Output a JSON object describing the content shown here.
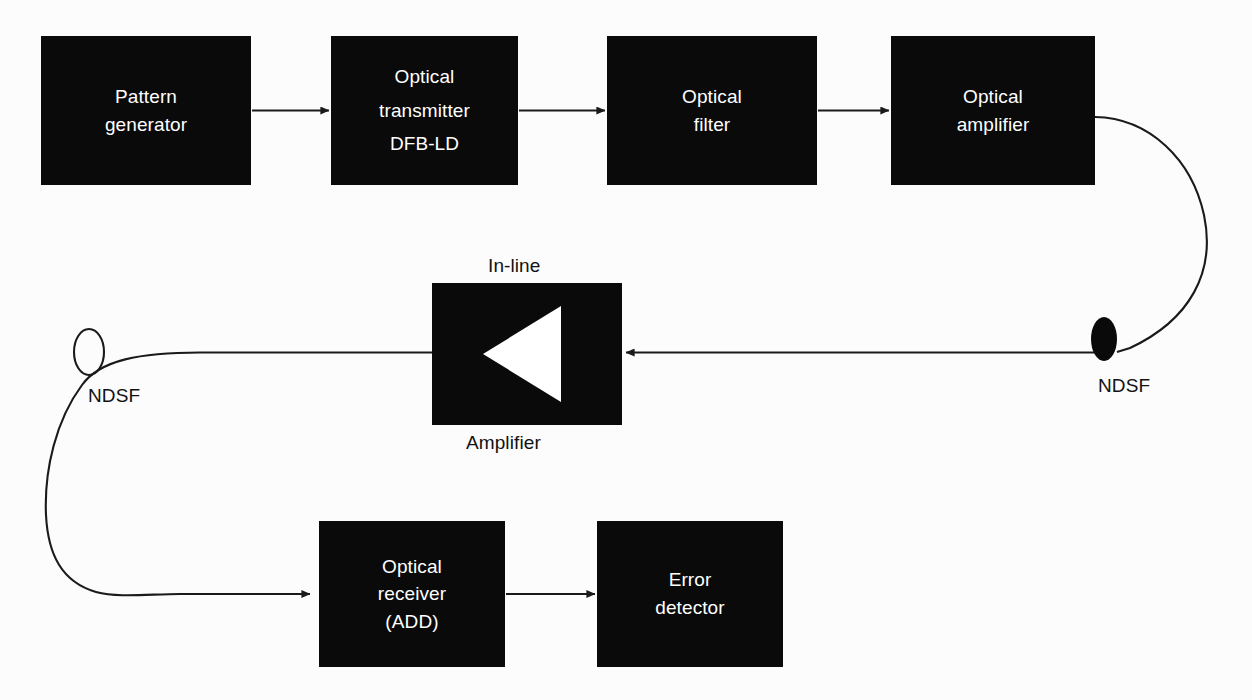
{
  "diagram": {
    "background_color": "#fcfcfc",
    "block_fill_color": "#0a0a0a",
    "block_text_color": "#ffffff",
    "line_color": "#1a1a1a",
    "caption_text_color": "#111111"
  },
  "blocks": [
    {
      "id": "pattern-generator",
      "lines": [
        "Pattern",
        "generator"
      ],
      "x": 41,
      "y": 36,
      "w": 210,
      "h": 149
    },
    {
      "id": "optical-transmitter",
      "lines": [
        "Optical",
        "transmitter",
        "DFB-LD"
      ],
      "x": 331,
      "y": 36,
      "w": 187,
      "h": 149
    },
    {
      "id": "optical-filter",
      "lines": [
        "Optical",
        "filter"
      ],
      "x": 607,
      "y": 36,
      "w": 210,
      "h": 149
    },
    {
      "id": "optical-amplifier",
      "lines": [
        "Optical",
        "amplifier"
      ],
      "x": 891,
      "y": 36,
      "w": 204,
      "h": 149
    },
    {
      "id": "in-line-amplifier",
      "lines": [],
      "x": 432,
      "y": 283,
      "w": 190,
      "h": 142
    },
    {
      "id": "optical-receiver",
      "lines": [
        "Optical",
        "receiver",
        "(ADD)"
      ],
      "x": 319,
      "y": 521,
      "w": 186,
      "h": 146
    },
    {
      "id": "error-detector",
      "lines": [
        "Error",
        "detector"
      ],
      "x": 597,
      "y": 521,
      "w": 186,
      "h": 146
    }
  ],
  "captions": [
    {
      "id": "in-line-label",
      "text": "In-line",
      "x": 488,
      "y": 255
    },
    {
      "id": "amplifier-label",
      "text": "Amplifier",
      "x": 466,
      "y": 432
    },
    {
      "id": "ndsf-right-label",
      "text": "NDSF",
      "x": 1098,
      "y": 375
    },
    {
      "id": "ndsf-left-label",
      "text": "NDSF",
      "x": 88,
      "y": 385
    }
  ],
  "fiber_spools": [
    {
      "id": "ndsf-right-spool",
      "cx": 1104,
      "cy": 339,
      "rx": 13,
      "ry": 22,
      "filled": true
    },
    {
      "id": "ndsf-left-spool",
      "cx": 89,
      "cy": 352,
      "rx": 15,
      "ry": 23,
      "filled": false
    }
  ],
  "connectors": [
    {
      "id": "pattern-to-transmitter",
      "kind": "arrow",
      "from": "pattern-generator",
      "to": "optical-transmitter"
    },
    {
      "id": "transmitter-to-filter",
      "kind": "arrow",
      "from": "optical-transmitter",
      "to": "optical-filter"
    },
    {
      "id": "filter-to-amplifier",
      "kind": "arrow",
      "from": "optical-filter",
      "to": "optical-amplifier"
    },
    {
      "id": "amplifier-to-ndsf-right",
      "kind": "curve",
      "from": "optical-amplifier",
      "to": "ndsf-right-spool"
    },
    {
      "id": "ndsf-right-to-inline-amplifier",
      "kind": "arrow",
      "from": "ndsf-right-spool",
      "to": "in-line-amplifier"
    },
    {
      "id": "inline-amplifier-to-ndsf-left",
      "kind": "curve",
      "from": "in-line-amplifier",
      "to": "ndsf-left-spool"
    },
    {
      "id": "ndsf-left-to-receiver",
      "kind": "arrow",
      "from": "ndsf-left-spool",
      "to": "optical-receiver"
    },
    {
      "id": "receiver-to-error-detector",
      "kind": "arrow",
      "from": "optical-receiver",
      "to": "error-detector"
    }
  ]
}
